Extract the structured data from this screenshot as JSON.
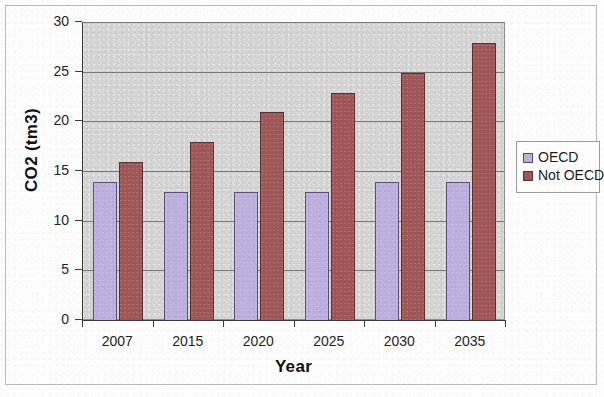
{
  "chart_data": {
    "type": "bar",
    "title": "",
    "xlabel": "Year",
    "ylabel": "CO2 (tm3)",
    "categories": [
      "2007",
      "2015",
      "2020",
      "2025",
      "2030",
      "2035"
    ],
    "series": [
      {
        "name": "OECD",
        "color": "#bdb0e0",
        "values": [
          14,
          13,
          13,
          13,
          14,
          14
        ]
      },
      {
        "name": "Not OECD",
        "color": "#a15757",
        "values": [
          16,
          18,
          21,
          23,
          25,
          28
        ]
      }
    ],
    "ylim": [
      0,
      30
    ],
    "ytick_values": [
      0,
      5,
      10,
      15,
      20,
      25,
      30
    ],
    "ytick_labels": [
      "0",
      "5",
      "10",
      "15",
      "20",
      "25",
      "30"
    ],
    "grid": true,
    "grid_axis": "y",
    "legend_position": "right",
    "plot_background": "#d5d5d5",
    "page_background": "#fdfdfd"
  },
  "legend": {
    "items": [
      {
        "label": "OECD"
      },
      {
        "label": "Not OECD"
      }
    ]
  },
  "axes": {
    "y_title": "CO2 (tm3)",
    "x_title": "Year"
  }
}
